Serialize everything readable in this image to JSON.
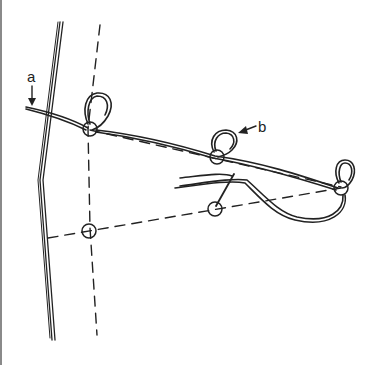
{
  "figure": {
    "type": "line-drawing",
    "labels": {
      "a": "a",
      "b": "b"
    },
    "colors": {
      "ink": "#222222",
      "background": "#ffffff",
      "border": "#8a8a8a"
    },
    "elements": {
      "stake": "double vertical line with kink",
      "guide_line": "dashed line",
      "rings_upper": 3,
      "rings_lower": 2,
      "loops": 3
    }
  }
}
